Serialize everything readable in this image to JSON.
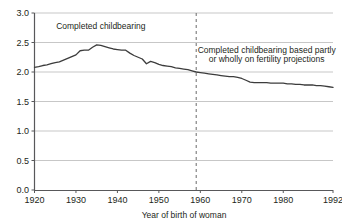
{
  "chart_data": {
    "type": "line",
    "title": "",
    "xlabel": "Year of birth of woman",
    "ylabel": "",
    "xlim": [
      1920,
      1992
    ],
    "ylim": [
      0.0,
      3.0
    ],
    "grid": true,
    "legend_position": "none",
    "ytick_labels": [
      "0.0",
      "0.5",
      "1.0",
      "1.5",
      "2.0",
      "2.5",
      "3.0"
    ],
    "ytick_values": [
      0.0,
      0.5,
      1.0,
      1.5,
      2.0,
      2.5,
      3.0
    ],
    "xtick_labels": [
      "1920",
      "1930",
      "1940",
      "1950",
      "1960",
      "1970",
      "1980",
      "1992"
    ],
    "xtick_values": [
      1920,
      1930,
      1940,
      1950,
      1960,
      1970,
      1980,
      1992
    ],
    "line_color": "#3c3c3c",
    "grid_color": "#b9b9b9",
    "axis_color": "#58585a",
    "annotations": [
      {
        "name": "completed-childbearing-label",
        "text": "Completed childbearing",
        "x": 1936,
        "y": 2.73
      },
      {
        "name": "projection-label-line1",
        "text": "Completed childbearing based partly",
        "x": 1976,
        "y": 2.32
      },
      {
        "name": "projection-label-line2",
        "text": "or wholly on fertility projections",
        "x": 1976,
        "y": 2.17
      }
    ],
    "divider": {
      "name": "projection-boundary",
      "x": 1959,
      "style": "dashed",
      "color": "#6b6b6b"
    },
    "series": [
      {
        "name": "Completed family size",
        "x": [
          1920,
          1921,
          1922,
          1923,
          1924,
          1925,
          1926,
          1927,
          1928,
          1929,
          1930,
          1931,
          1932,
          1933,
          1934,
          1935,
          1936,
          1937,
          1938,
          1939,
          1940,
          1941,
          1942,
          1943,
          1944,
          1945,
          1946,
          1947,
          1948,
          1949,
          1950,
          1951,
          1952,
          1953,
          1954,
          1955,
          1956,
          1957,
          1958,
          1959,
          1960,
          1961,
          1962,
          1963,
          1964,
          1965,
          1966,
          1967,
          1968,
          1969,
          1970,
          1971,
          1972,
          1973,
          1974,
          1975,
          1976,
          1977,
          1978,
          1979,
          1980,
          1981,
          1982,
          1983,
          1984,
          1985,
          1986,
          1987,
          1988,
          1989,
          1990,
          1991,
          1992
        ],
        "values": [
          2.08,
          2.09,
          2.11,
          2.12,
          2.14,
          2.16,
          2.17,
          2.2,
          2.23,
          2.26,
          2.29,
          2.36,
          2.37,
          2.37,
          2.42,
          2.46,
          2.45,
          2.43,
          2.41,
          2.39,
          2.38,
          2.37,
          2.37,
          2.32,
          2.28,
          2.25,
          2.22,
          2.14,
          2.18,
          2.16,
          2.13,
          2.11,
          2.1,
          2.09,
          2.07,
          2.06,
          2.05,
          2.04,
          2.02,
          2.0,
          1.99,
          1.98,
          1.97,
          1.96,
          1.95,
          1.94,
          1.93,
          1.92,
          1.92,
          1.91,
          1.89,
          1.86,
          1.83,
          1.82,
          1.82,
          1.82,
          1.82,
          1.81,
          1.81,
          1.81,
          1.81,
          1.8,
          1.8,
          1.79,
          1.79,
          1.78,
          1.78,
          1.78,
          1.77,
          1.77,
          1.76,
          1.75,
          1.74
        ]
      }
    ]
  }
}
